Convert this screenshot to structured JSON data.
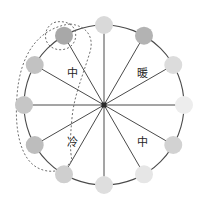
{
  "diagram": {
    "center": {
      "x": 104,
      "y": 105
    },
    "radius": 80,
    "node_radius": 9,
    "ring_stroke": "#4a4a4a",
    "spoke_stroke": "#4a4a4a",
    "lasso_stroke": "#6e6e6e",
    "background": "#ffffff",
    "nodes": [
      {
        "id": "node-12",
        "label": "",
        "angle_deg": -90,
        "color": "#d9d9d9",
        "selected": false
      },
      {
        "id": "node-1",
        "label": "",
        "angle_deg": -60,
        "color": "#b3b3b3",
        "selected": false
      },
      {
        "id": "node-2",
        "label": "",
        "angle_deg": -30,
        "color": "#dcdcdc",
        "selected": false
      },
      {
        "id": "node-3",
        "label": "",
        "angle_deg": 0,
        "color": "#ededed",
        "selected": false
      },
      {
        "id": "node-4",
        "label": "",
        "angle_deg": 30,
        "color": "#d2d2d2",
        "selected": false
      },
      {
        "id": "node-5",
        "label": "",
        "angle_deg": 60,
        "color": "#e6e6e6",
        "selected": false
      },
      {
        "id": "node-6",
        "label": "",
        "angle_deg": 90,
        "color": "#dedede",
        "selected": false
      },
      {
        "id": "node-7",
        "label": "",
        "angle_deg": 120,
        "color": "#cfcfcf",
        "selected": false
      },
      {
        "id": "node-8",
        "label": "",
        "angle_deg": 150,
        "color": "#bdbdbd",
        "selected": true
      },
      {
        "id": "node-9",
        "label": "",
        "angle_deg": 180,
        "color": "#c6c6c6",
        "selected": true
      },
      {
        "id": "node-10",
        "label": "",
        "angle_deg": -150,
        "color": "#c2c2c2",
        "selected": true
      },
      {
        "id": "node-11",
        "label": "",
        "angle_deg": -120,
        "color": "#a8a8a8",
        "selected": true
      }
    ],
    "quadrant_labels": [
      {
        "id": "label-upper-left",
        "text": "中",
        "x": 72,
        "y": 74,
        "meaning": "medium"
      },
      {
        "id": "label-upper-right",
        "text": "暖",
        "x": 142,
        "y": 74,
        "meaning": "warm"
      },
      {
        "id": "label-lower-left",
        "text": "冷",
        "x": 72,
        "y": 143,
        "meaning": "cool"
      },
      {
        "id": "label-lower-right",
        "text": "中",
        "x": 142,
        "y": 143,
        "meaning": "medium"
      }
    ],
    "selection_lasso": {
      "id": "selection-lasso",
      "description": "dotted closed loop enclosing the four left-side nodes",
      "dash": "2,2"
    }
  }
}
